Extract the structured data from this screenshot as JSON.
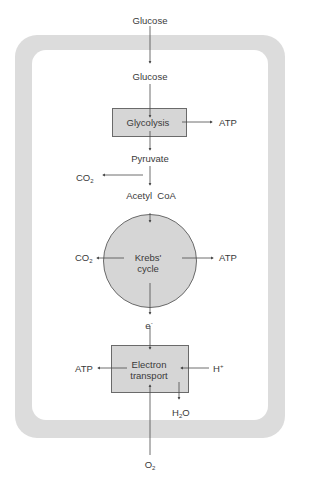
{
  "diagram": {
    "outside": {
      "glucose_in": "Glucose",
      "oxygen_in": "O",
      "oxygen_sub": "2"
    },
    "cytoplasm": {
      "glucose": "Glucose"
    },
    "glycolysis": {
      "label": "Glycolysis",
      "output_atp": "ATP"
    },
    "pyruvate": {
      "label": "Pyruvate",
      "co2": "CO",
      "co2_sub": "2"
    },
    "acetyl_coa": {
      "label": "Acetyl  CoA"
    },
    "krebs": {
      "line1": "Krebs'",
      "line2": "cycle",
      "co2": "CO",
      "co2_sub": "2",
      "output_atp": "ATP"
    },
    "electron": {
      "label": "e",
      "sup": "-"
    },
    "electron_transport": {
      "line1": "Electron",
      "line2": "transport",
      "output_atp": "ATP",
      "h_plus": "H",
      "h_sup": "+",
      "water": "H",
      "water_sub": "2",
      "water_o": "O"
    }
  },
  "colors": {
    "band": "#dcdcdc",
    "fill": "#d6d6d6",
    "stroke": "#6a6a6a",
    "text": "#3a3a3a"
  }
}
